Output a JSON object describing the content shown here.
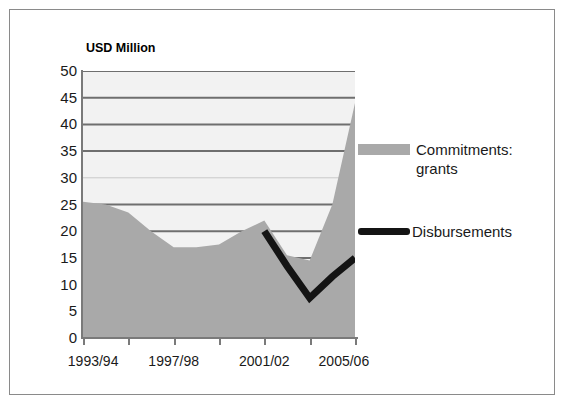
{
  "figure": {
    "title": "(2005/06 constant prices)",
    "frame_border_color": "#8a8a8a",
    "plot_background": "#f2f2f2"
  },
  "axis_title": {
    "y_units": "USD Million"
  },
  "legend": {
    "position": "right",
    "entries": [
      {
        "name": "commitments-grants",
        "label": "Commitments: grants",
        "swatch": "area",
        "color": "#a9a9a9"
      },
      {
        "name": "disbursements",
        "label": "Disbursements",
        "swatch": "line",
        "color": "#141414"
      }
    ]
  },
  "chart_data": {
    "type": "area",
    "title": "(2005/06 constant prices)",
    "xlabel": "",
    "ylabel": "USD Million",
    "ylim": [
      0,
      50
    ],
    "ytick_labels": [
      "50",
      "45",
      "40",
      "35",
      "30",
      "25",
      "20",
      "15",
      "10",
      "5",
      "0"
    ],
    "ytick_values": [
      50,
      45,
      40,
      35,
      30,
      25,
      20,
      15,
      10,
      5,
      0
    ],
    "grid": true,
    "grid_axis": "y",
    "x": [
      "1993/94",
      "1994/95",
      "1995/96",
      "1996/97",
      "1997/98",
      "1998/99",
      "1999/00",
      "2000/01",
      "2001/02",
      "2002/03",
      "2003/04",
      "2004/05",
      "2005/06"
    ],
    "xtick_labels": [
      "1993/94",
      "1997/98",
      "2001/02",
      "2005/06"
    ],
    "xtick_label_indices": [
      0,
      4,
      8,
      12
    ],
    "series": [
      {
        "name": "Commitments: grants",
        "type": "area",
        "color": "#a9a9a9",
        "values": [
          25.5,
          25.0,
          23.5,
          20.0,
          17.0,
          17.0,
          17.5,
          20.0,
          22.0,
          15.5,
          14.5,
          25.0,
          44.0
        ]
      },
      {
        "name": "Disbursements",
        "type": "line",
        "color": "#141414",
        "values": [
          null,
          null,
          null,
          null,
          null,
          null,
          null,
          null,
          20.0,
          13.5,
          7.5,
          11.5,
          15.0
        ]
      }
    ]
  }
}
